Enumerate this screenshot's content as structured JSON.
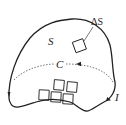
{
  "diagram": {
    "type": "surface-circulation-diagram",
    "labels": {
      "surface": "S",
      "area_element": "ΔS",
      "curve": "C",
      "current": "I"
    },
    "elements": {
      "boundary_curve": "closed surface boundary with direction arrows",
      "dashed_loop": "dashed closed curve C across surface with arrow",
      "area_element": "small square patch with circulation arrows",
      "patch_grid": "5 small square patches near bottom with circulation arrows"
    },
    "colors": {
      "stroke": "#222222",
      "background": "#ffffff"
    }
  }
}
